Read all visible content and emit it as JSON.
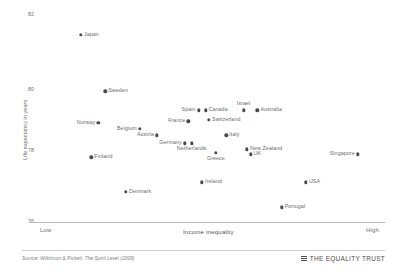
{
  "chart_data": {
    "type": "scatter",
    "title": "",
    "xlabel": "Income inequality",
    "ylabel": "Life expectancy in years",
    "xlim": [
      0,
      100
    ],
    "ylim": [
      76,
      82.6
    ],
    "grid": false,
    "legend": "none",
    "x_tick_labels": [
      "Low",
      "High"
    ],
    "y_tick_labels": [
      "82",
      "80",
      "78",
      "76"
    ],
    "y_ticks": [
      82,
      80,
      78,
      76
    ],
    "points": [
      {
        "label": "Japan",
        "x": 13,
        "y": 81.9,
        "label_side": "right"
      },
      {
        "label": "Sweden",
        "x": 20,
        "y": 80.1,
        "label_side": "right"
      },
      {
        "label": "Norway",
        "x": 18,
        "y": 79.1,
        "label_side": "left"
      },
      {
        "label": "Belgium",
        "x": 30,
        "y": 78.9,
        "label_side": "left"
      },
      {
        "label": "Austria",
        "x": 35,
        "y": 78.7,
        "label_side": "left"
      },
      {
        "label": "Germany",
        "x": 43,
        "y": 78.45,
        "label_side": "left"
      },
      {
        "label": "Netherlands",
        "x": 45,
        "y": 78.45,
        "label_side": "below"
      },
      {
        "label": "Finland",
        "x": 16,
        "y": 78.0,
        "label_side": "right"
      },
      {
        "label": "Spain",
        "x": 47,
        "y": 79.5,
        "label_side": "left"
      },
      {
        "label": "Canada",
        "x": 49,
        "y": 79.5,
        "label_side": "right"
      },
      {
        "label": "Switzerland",
        "x": 50,
        "y": 79.2,
        "label_side": "right"
      },
      {
        "label": "France",
        "x": 44,
        "y": 79.15,
        "label_side": "left"
      },
      {
        "label": "Italy",
        "x": 55,
        "y": 78.7,
        "label_side": "right"
      },
      {
        "label": "Israel",
        "x": 60,
        "y": 79.5,
        "label_side": "above"
      },
      {
        "label": "Australia",
        "x": 64,
        "y": 79.5,
        "label_side": "right"
      },
      {
        "label": "New Zealand",
        "x": 61,
        "y": 78.25,
        "label_side": "right"
      },
      {
        "label": "UK",
        "x": 62,
        "y": 78.1,
        "label_side": "right"
      },
      {
        "label": "Greece",
        "x": 52,
        "y": 78.15,
        "label_side": "below"
      },
      {
        "label": "Singapore",
        "x": 93,
        "y": 78.1,
        "label_side": "left"
      },
      {
        "label": "Ireland",
        "x": 48,
        "y": 77.2,
        "label_side": "right"
      },
      {
        "label": "USA",
        "x": 78,
        "y": 77.2,
        "label_side": "right"
      },
      {
        "label": "Denmark",
        "x": 26,
        "y": 76.9,
        "label_side": "right"
      },
      {
        "label": "Portugal",
        "x": 71,
        "y": 76.4,
        "label_side": "right"
      }
    ]
  },
  "footer": {
    "source": "Source: Wilkinson & Pickett, The Spirit Level (2009)",
    "brand": "THE EQUALITY TRUST"
  }
}
